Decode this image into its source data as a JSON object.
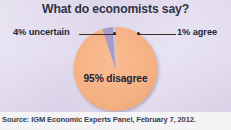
{
  "figure": {
    "background_color": "#ded7ea",
    "source_band_color": "#f4f3f6"
  },
  "title": "What do economists say?",
  "source": "Source: IGM Economic Experts Panel, February 7, 2012.",
  "labels": {
    "uncertain": "4% uncertain",
    "agree": "1% agree",
    "disagree": "95% disagree"
  },
  "chart_data": {
    "type": "pie",
    "title": "What do economists say?",
    "xlabel": "",
    "ylabel": "",
    "categories": [
      "95% disagree",
      "4% uncertain",
      "1% agree"
    ],
    "labels": [
      "disagree",
      "uncertain",
      "agree"
    ],
    "values": [
      95,
      4,
      1
    ],
    "unit": "percent",
    "colors": [
      "#f4b183",
      "#a79bc9",
      "#cfc7e2"
    ],
    "start_angle_deg": 90,
    "direction": "counterclockwise",
    "legend": "none",
    "annotations": [
      {
        "text": "4% uncertain",
        "position": "left",
        "leader_line": true
      },
      {
        "text": "1% agree",
        "position": "right",
        "leader_line": true
      },
      {
        "text": "95% disagree",
        "position": "inside"
      }
    ],
    "source": "Source: IGM Economic Experts Panel, February 7, 2012."
  }
}
